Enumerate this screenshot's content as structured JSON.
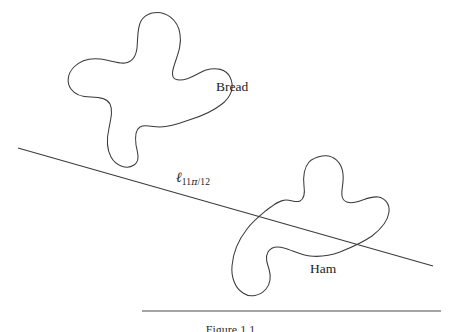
{
  "figure": {
    "domain_kind": "geometric-diagram",
    "background_color": "#ffffff",
    "stroke_color": "#3b3b3b",
    "text_color": "#1c1c1c",
    "width": 461,
    "height": 332,
    "caption": "Figure 1.1"
  },
  "labels": {
    "bread": "Bread",
    "ham": "Ham",
    "line_symbol": "ℓ",
    "line_subscript_numerator": "11",
    "line_subscript_pi": "π",
    "line_subscript_slash": "/",
    "line_subscript_denominator": "12",
    "line_full": "ℓ 11π/12"
  },
  "shapes": {
    "bread": {
      "name": "Bread",
      "kind": "closed-blob",
      "lobes": 4,
      "bbox": [
        85,
        12,
        215,
        166
      ],
      "centroid": [
        150,
        90
      ]
    },
    "ham": {
      "name": "Ham",
      "kind": "closed-blob",
      "lobes": 3,
      "bbox": [
        230,
        155,
        386,
        301
      ],
      "centroid": [
        305,
        228
      ]
    }
  },
  "line": {
    "name": "cut-line",
    "label": "ℓ 11π/12",
    "angle_radians_label": "11π/12",
    "start": [
      18,
      148
    ],
    "end": [
      433,
      266
    ],
    "crosses": [
      "Ham"
    ]
  },
  "caption_rule": {
    "start": [
      142,
      311
    ],
    "end": [
      441,
      311
    ]
  }
}
